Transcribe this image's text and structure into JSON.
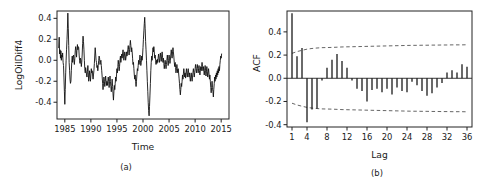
{
  "figure": {
    "panels": [
      {
        "id": "a",
        "caption": "(a)"
      },
      {
        "id": "b",
        "caption": "(b)"
      }
    ]
  },
  "chart_data": [
    {
      "type": "line",
      "panel": "a",
      "title": "",
      "xlabel": "Time",
      "ylabel": "LogOilDiff4",
      "xlim": [
        1983.5,
        2016.5
      ],
      "ylim": [
        -0.56,
        0.47
      ],
      "xticks": [
        1985,
        1990,
        1995,
        2000,
        2005,
        2010,
        2015
      ],
      "xticklabels": [
        "1985",
        "1990",
        "1995",
        "2000",
        "2005",
        "2010",
        "2015"
      ],
      "yticks": [
        -0.4,
        -0.2,
        0.0,
        0.2,
        0.4
      ],
      "yticklabels": [
        "-0.4",
        "-0.2",
        "0.0",
        "0.2",
        "0.4"
      ],
      "grid": false,
      "legend": null,
      "x": [
        1983.83,
        1983.92,
        1984.0,
        1984.08,
        1984.17,
        1984.25,
        1984.33,
        1984.42,
        1984.5,
        1984.58,
        1984.67,
        1984.75,
        1984.83,
        1984.92,
        1985.0,
        1985.08,
        1985.17,
        1985.25,
        1985.33,
        1985.42,
        1985.5,
        1985.58,
        1985.67,
        1985.75,
        1985.83,
        1985.92,
        1986.0,
        1986.08,
        1986.17,
        1986.25,
        1986.33,
        1986.42,
        1986.5,
        1986.58,
        1986.67,
        1986.75,
        1986.83,
        1986.92,
        1987.0,
        1987.08,
        1987.17,
        1987.25,
        1987.33,
        1987.42,
        1987.5,
        1987.58,
        1987.67,
        1987.75,
        1987.83,
        1987.92,
        1988.0,
        1988.08,
        1988.17,
        1988.25,
        1988.33,
        1988.42,
        1988.5,
        1988.58,
        1988.67,
        1988.75,
        1988.83,
        1988.92,
        1989.0,
        1989.08,
        1989.17,
        1989.25,
        1989.33,
        1989.42,
        1989.5,
        1989.58,
        1989.67,
        1989.75,
        1989.83,
        1989.92,
        1990.0,
        1990.08,
        1990.17,
        1990.25,
        1990.33,
        1990.42,
        1990.5,
        1990.58,
        1990.67,
        1990.75,
        1990.83,
        1990.92,
        1991.0,
        1991.08,
        1991.17,
        1991.25,
        1991.33,
        1991.42,
        1991.5,
        1991.58,
        1991.67,
        1991.75,
        1991.83,
        1991.92,
        1992.0,
        1992.08,
        1992.17,
        1992.25,
        1992.33,
        1992.42,
        1992.5,
        1992.58,
        1992.67,
        1992.75,
        1992.83,
        1992.92,
        1993.0,
        1993.08,
        1993.17,
        1993.25,
        1993.33,
        1993.42,
        1993.5,
        1993.58,
        1993.67,
        1993.75,
        1993.83,
        1993.92,
        1994.0,
        1994.08,
        1994.17,
        1994.25,
        1994.33,
        1994.42,
        1994.5,
        1994.58,
        1994.67,
        1994.75,
        1994.83,
        1994.92,
        1995.0,
        1995.08,
        1995.17,
        1995.25,
        1995.33,
        1995.42,
        1995.5,
        1995.58,
        1995.67,
        1995.75,
        1995.83,
        1995.92,
        1996.0,
        1996.08,
        1996.17,
        1996.25,
        1996.33,
        1996.42,
        1996.5,
        1996.58,
        1996.67,
        1996.75,
        1996.83,
        1996.92,
        1997.0,
        1997.08,
        1997.17,
        1997.25,
        1997.33,
        1997.42,
        1997.5,
        1997.58,
        1997.67,
        1997.75,
        1997.83,
        1997.92,
        1998.0,
        1998.08,
        1998.17,
        1998.25,
        1998.33,
        1998.42,
        1998.5,
        1998.58,
        1998.67,
        1998.75,
        1998.83,
        1998.92,
        1999.0,
        1999.08,
        1999.17,
        1999.25,
        1999.33,
        1999.42,
        1999.5,
        1999.58,
        1999.67,
        1999.75,
        1999.83,
        1999.92,
        2000.0,
        2000.08,
        2000.17,
        2000.25,
        2000.33,
        2000.42,
        2000.5,
        2000.58,
        2000.67,
        2000.75,
        2000.83,
        2000.92,
        2001.0,
        2001.08,
        2001.17,
        2001.25,
        2001.33,
        2001.42,
        2001.5,
        2001.58,
        2001.67,
        2001.75,
        2001.83,
        2001.92,
        2002.0,
        2002.08,
        2002.17,
        2002.25,
        2002.33,
        2002.42,
        2002.5,
        2002.58,
        2002.67,
        2002.75,
        2002.83,
        2002.92,
        2003.0,
        2003.08,
        2003.17,
        2003.25,
        2003.33,
        2003.42,
        2003.5,
        2003.58,
        2003.67,
        2003.75,
        2003.83,
        2003.92,
        2004.0,
        2004.08,
        2004.17,
        2004.25,
        2004.33,
        2004.42,
        2004.5,
        2004.58,
        2004.67,
        2004.75,
        2004.83,
        2004.92,
        2005.0,
        2005.08,
        2005.17,
        2005.25,
        2005.33,
        2005.42,
        2005.5,
        2005.58,
        2005.67,
        2005.75,
        2005.83,
        2005.92,
        2006.0,
        2006.08,
        2006.17,
        2006.25,
        2006.33,
        2006.42,
        2006.5,
        2006.58,
        2006.67,
        2006.75,
        2006.83,
        2006.92,
        2007.0,
        2007.08,
        2007.17,
        2007.25,
        2007.33,
        2007.42,
        2007.5,
        2007.58,
        2007.67,
        2007.75,
        2007.83,
        2007.92,
        2008.0,
        2008.08,
        2008.17,
        2008.25,
        2008.33,
        2008.42,
        2008.5,
        2008.58,
        2008.67,
        2008.75,
        2008.83,
        2008.92,
        2009.0,
        2009.08,
        2009.17,
        2009.25,
        2009.33,
        2009.42,
        2009.5,
        2009.58,
        2009.67,
        2009.75,
        2009.83,
        2009.92,
        2010.0,
        2010.08,
        2010.17,
        2010.25,
        2010.33,
        2010.42,
        2010.5,
        2010.58,
        2010.67,
        2010.75,
        2010.83,
        2010.92,
        2011.0,
        2011.08,
        2011.17,
        2011.25,
        2011.33,
        2011.42,
        2011.5,
        2011.58,
        2011.67,
        2011.75,
        2011.83,
        2011.92,
        2012.0,
        2012.08,
        2012.17,
        2012.25,
        2012.33,
        2012.42,
        2012.5,
        2012.58,
        2012.67,
        2012.75,
        2012.83,
        2012.92,
        2013.0,
        2013.08,
        2013.17,
        2013.25,
        2013.33,
        2013.42,
        2013.5,
        2013.58,
        2013.67,
        2013.75,
        2013.83,
        2013.92,
        2014.0,
        2014.08,
        2014.17,
        2014.25,
        2014.33,
        2014.42,
        2014.5,
        2014.58,
        2014.67,
        2014.75,
        2014.83,
        2014.92,
        2015.0,
        2015.08,
        2015.17,
        2015.25,
        2015.33,
        2015.42,
        2015.5,
        2015.58,
        2015.67,
        2015.75,
        2015.83,
        2015.92,
        2016.0,
        2016.08,
        2016.17
      ],
      "y": [
        0.12,
        0.22,
        0.06,
        0.1,
        0.02,
        0.09,
        0.0,
        0.05,
        0.03,
        0.07,
        -0.02,
        -0.05,
        -0.16,
        -0.3,
        -0.42,
        -0.28,
        -0.12,
        0.0,
        0.1,
        0.2,
        0.3,
        0.45,
        0.3,
        0.14,
        -0.02,
        -0.1,
        -0.18,
        -0.22,
        -0.2,
        -0.1,
        -0.02,
        0.04,
        -0.02,
        0.03,
        0.05,
        0.0,
        -0.04,
        0.02,
        0.09,
        0.13,
        0.09,
        0.03,
        0.1,
        0.15,
        0.1,
        0.13,
        0.12,
        0.05,
        0.0,
        -0.03,
        0.02,
        0.0,
        -0.06,
        -0.02,
        0.05,
        0.16,
        0.23,
        0.18,
        0.1,
        0.0,
        -0.08,
        -0.12,
        -0.07,
        -0.1,
        -0.14,
        -0.16,
        -0.11,
        -0.05,
        -0.12,
        -0.2,
        -0.16,
        -0.1,
        -0.15,
        -0.2,
        -0.14,
        -0.08,
        -0.12,
        -0.1,
        -0.14,
        -0.18,
        -0.14,
        -0.1,
        -0.03,
        0.05,
        0.12,
        0.06,
        0.0,
        -0.02,
        -0.07,
        -0.05,
        -0.1,
        -0.05,
        0.0,
        0.04,
        0.02,
        -0.04,
        -0.02,
        0.0,
        -0.05,
        -0.1,
        -0.16,
        -0.22,
        -0.28,
        -0.22,
        -0.16,
        -0.2,
        -0.25,
        -0.2,
        -0.15,
        -0.2,
        -0.24,
        -0.2,
        -0.24,
        -0.2,
        -0.16,
        -0.2,
        -0.26,
        -0.2,
        -0.15,
        -0.2,
        -0.25,
        -0.3,
        -0.24,
        -0.18,
        -0.25,
        -0.32,
        -0.38,
        -0.3,
        -0.24,
        -0.28,
        -0.22,
        -0.16,
        -0.2,
        -0.14,
        -0.08,
        -0.12,
        -0.06,
        0.0,
        -0.04,
        -0.1,
        -0.06,
        0.0,
        0.04,
        -0.02,
        0.02,
        0.06,
        0.02,
        0.06,
        0.1,
        0.05,
        0.0,
        0.04,
        0.08,
        0.05,
        0.0,
        0.03,
        0.08,
        0.04,
        0.06,
        0.1,
        0.14,
        0.1,
        0.05,
        0.1,
        0.14,
        0.19,
        0.14,
        0.08,
        0.12,
        0.08,
        0.02,
        -0.04,
        -0.02,
        -0.08,
        -0.14,
        -0.18,
        -0.14,
        -0.2,
        -0.25,
        -0.2,
        -0.14,
        -0.08,
        -0.1,
        -0.05,
        0.0,
        -0.04,
        0.0,
        0.05,
        0.0,
        -0.05,
        -0.02,
        0.04,
        0.0,
        0.05,
        0.12,
        0.2,
        0.28,
        0.35,
        0.41,
        0.3,
        0.18,
        0.1,
        0.0,
        -0.1,
        -0.2,
        -0.3,
        -0.4,
        -0.48,
        -0.53,
        -0.44,
        -0.34,
        -0.22,
        -0.1,
        -0.02,
        0.04,
        0.0,
        0.06,
        0.12,
        0.08,
        0.13,
        0.08,
        0.02,
        0.05,
        0.0,
        -0.04,
        0.0,
        -0.03,
        0.01,
        -0.02,
        0.03,
        0.06,
        0.02,
        -0.02,
        0.02,
        0.07,
        0.03,
        -0.01,
        0.04,
        0.08,
        0.03,
        -0.02,
        0.02,
        -0.03,
        -0.08,
        -0.04,
        0.0,
        -0.04,
        -0.08,
        -0.04,
        0.0,
        0.05,
        0.0,
        -0.05,
        0.0,
        0.05,
        0.02,
        -0.03,
        0.0,
        0.05,
        0.1,
        0.06,
        0.02,
        0.08,
        0.12,
        0.08,
        0.03,
        -0.02,
        -0.06,
        -0.02,
        -0.07,
        -0.12,
        -0.08,
        -0.04,
        -0.08,
        -0.12,
        -0.08,
        -0.12,
        -0.17,
        -0.22,
        -0.28,
        -0.33,
        -0.28,
        -0.22,
        -0.25,
        -0.2,
        -0.14,
        -0.18,
        -0.13,
        -0.08,
        -0.12,
        -0.16,
        -0.12,
        -0.17,
        -0.13,
        -0.08,
        -0.12,
        -0.16,
        -0.12,
        -0.08,
        -0.12,
        -0.16,
        -0.12,
        -0.16,
        -0.2,
        -0.16,
        -0.12,
        -0.16,
        -0.2,
        -0.16,
        -0.12,
        -0.08,
        -0.12,
        -0.16,
        -0.12,
        -0.08,
        -0.04,
        -0.08,
        -0.12,
        -0.08,
        -0.04,
        -0.08,
        -0.12,
        -0.08,
        -0.05,
        -0.1,
        -0.14,
        -0.1,
        -0.06,
        -0.1,
        -0.06,
        -0.02,
        -0.06,
        -0.1,
        -0.06,
        -0.1,
        -0.14,
        -0.1,
        -0.05,
        -0.1,
        -0.15,
        -0.11,
        -0.06,
        -0.11,
        -0.16,
        -0.12,
        -0.08,
        -0.13,
        -0.18,
        -0.14,
        -0.2,
        -0.26,
        -0.31,
        -0.26,
        -0.2,
        -0.26,
        -0.3,
        -0.35,
        -0.28,
        -0.22,
        -0.16,
        -0.2,
        -0.14,
        -0.18,
        -0.12,
        -0.16,
        -0.1,
        -0.14,
        -0.08,
        -0.12,
        -0.06,
        -0.1,
        -0.04,
        0.0,
        0.04,
        0.02,
        0.06
      ]
    },
    {
      "type": "bar",
      "panel": "b",
      "title": "",
      "xlabel": "Lag",
      "ylabel": "ACF",
      "xlim": [
        0,
        37
      ],
      "ylim": [
        -0.42,
        0.58
      ],
      "xticks": [
        1,
        4,
        8,
        12,
        16,
        20,
        24,
        28,
        32,
        36
      ],
      "xticklabels": [
        "1",
        "4",
        "8",
        "12",
        "16",
        "20",
        "24",
        "28",
        "32",
        "36"
      ],
      "yticks": [
        -0.4,
        -0.2,
        0.0,
        0.2,
        0.4
      ],
      "yticklabels": [
        "-0.4",
        "-0.2",
        "0.0",
        "0.2",
        "0.4"
      ],
      "grid": false,
      "legend": null,
      "confidence_level": "95%",
      "categories": [
        1,
        2,
        3,
        4,
        5,
        6,
        7,
        8,
        9,
        10,
        11,
        12,
        13,
        14,
        15,
        16,
        17,
        18,
        19,
        20,
        21,
        22,
        23,
        24,
        25,
        26,
        27,
        28,
        29,
        30,
        31,
        32,
        33,
        34,
        35,
        36
      ],
      "values": [
        0.56,
        0.19,
        0.26,
        -0.38,
        -0.27,
        -0.26,
        -0.02,
        0.09,
        0.16,
        0.21,
        0.15,
        0.09,
        -0.02,
        -0.09,
        -0.11,
        -0.2,
        -0.1,
        -0.09,
        -0.12,
        -0.09,
        -0.14,
        -0.08,
        -0.11,
        -0.12,
        -0.03,
        -0.06,
        -0.11,
        -0.15,
        -0.13,
        -0.08,
        -0.04,
        0.05,
        0.07,
        0.05,
        0.12,
        0.1
      ],
      "conf_upper": [
        0.215,
        0.23,
        0.241,
        0.251,
        0.257,
        0.261,
        0.264,
        0.265,
        0.266,
        0.268,
        0.27,
        0.271,
        0.272,
        0.273,
        0.274,
        0.275,
        0.276,
        0.277,
        0.278,
        0.279,
        0.28,
        0.281,
        0.282,
        0.283,
        0.284,
        0.284,
        0.285,
        0.285,
        0.286,
        0.286,
        0.287,
        0.287,
        0.288,
        0.288,
        0.288,
        0.289
      ],
      "conf_lower": [
        -0.215,
        -0.23,
        -0.241,
        -0.251,
        -0.257,
        -0.261,
        -0.264,
        -0.265,
        -0.266,
        -0.268,
        -0.27,
        -0.271,
        -0.272,
        -0.273,
        -0.274,
        -0.275,
        -0.276,
        -0.277,
        -0.278,
        -0.279,
        -0.28,
        -0.281,
        -0.282,
        -0.283,
        -0.284,
        -0.284,
        -0.285,
        -0.285,
        -0.286,
        -0.286,
        -0.287,
        -0.287,
        -0.288,
        -0.288,
        -0.288,
        -0.289
      ]
    }
  ],
  "colors": {
    "line": "#111111",
    "bar": "#111111",
    "confidence": "#555555",
    "axis": "#222222",
    "background": "#ffffff"
  }
}
